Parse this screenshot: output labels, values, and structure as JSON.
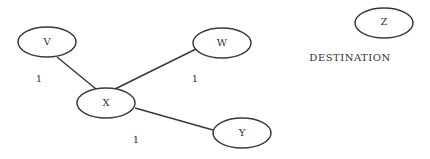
{
  "diagram": {
    "type": "graph",
    "nodes": [
      {
        "id": "V",
        "label": "V",
        "cx": 47,
        "cy": 42
      },
      {
        "id": "W",
        "label": "W",
        "cx": 220,
        "cy": 42
      },
      {
        "id": "X",
        "label": "X",
        "cx": 106,
        "cy": 103
      },
      {
        "id": "Y",
        "label": "Y",
        "cx": 242,
        "cy": 133
      },
      {
        "id": "Z",
        "label": "Z",
        "cx": 384,
        "cy": 22
      }
    ],
    "edges": [
      {
        "from": "V",
        "to": "X",
        "weight": "1"
      },
      {
        "from": "W",
        "to": "X",
        "weight": "1"
      },
      {
        "from": "X",
        "to": "Y",
        "weight": "1"
      }
    ],
    "weight_labels": [
      {
        "text": "1",
        "x": 39,
        "y": 79
      },
      {
        "text": "1",
        "x": 195,
        "y": 79
      },
      {
        "text": "1",
        "x": 136,
        "y": 140
      }
    ],
    "destination_caption": "DESTINATION",
    "colors": {
      "stroke": "#3a3a3a",
      "text": "#333333",
      "background": "#ffffff"
    }
  }
}
